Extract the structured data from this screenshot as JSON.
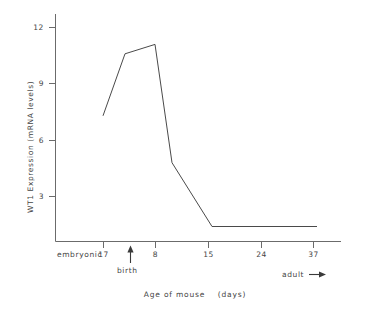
{
  "chart_data": {
    "type": "line",
    "title": "",
    "xlabel": "Age of mouse    (days)",
    "ylabel": "WT1 Expression (mRNA levels)",
    "x_tick_labels": [
      "17",
      "8",
      "15",
      "24",
      "37"
    ],
    "x_tick_positions_px": [
      103,
      155,
      208,
      261,
      313
    ],
    "x_prefix_label": "embryonic",
    "y_tick_labels": [
      "3",
      "6",
      "9",
      "12"
    ],
    "y_tick_values": [
      3,
      6,
      9,
      12
    ],
    "ylim": [
      0,
      13
    ],
    "grid": false,
    "legend": "none",
    "annotations": [
      {
        "name": "birth",
        "text": "birth",
        "marker": "up-arrow",
        "x_px": 130
      },
      {
        "name": "adult",
        "text": "adult",
        "marker": "right-arrow",
        "x_px": 300
      }
    ],
    "series": [
      {
        "name": "WT1 mRNA expression",
        "points": [
          {
            "x_label": "embryonic 17",
            "x_px": 103,
            "y": 7.3
          },
          {
            "x_label": "birth",
            "x_px": 125,
            "y": 10.6
          },
          {
            "x_label": "8",
            "x_px": 155,
            "y": 11.1
          },
          {
            "x_label": "~10",
            "x_px": 172,
            "y": 4.8
          },
          {
            "x_label": "15",
            "x_px": 212,
            "y": 1.4
          },
          {
            "x_label": "37+",
            "x_px": 317,
            "y": 1.4
          }
        ]
      }
    ]
  },
  "axes": {
    "x_axis_label": "Age of mouse    (days)",
    "y_axis_label": "WT1 Expression (mRNA levels)",
    "embryonic_label": "embryonic",
    "x_ticks": [
      {
        "label": "17"
      },
      {
        "label": "8"
      },
      {
        "label": "15"
      },
      {
        "label": "24"
      },
      {
        "label": "37"
      }
    ],
    "y_ticks": [
      {
        "label": "12"
      },
      {
        "label": "9"
      },
      {
        "label": "6"
      },
      {
        "label": "3"
      }
    ]
  },
  "annotations": {
    "birth_label": "birth",
    "adult_label": "adult"
  },
  "colors": {
    "line": "#4a4a4a",
    "axis": "#6b6b6b",
    "text": "#444444",
    "background": "#ffffff"
  }
}
